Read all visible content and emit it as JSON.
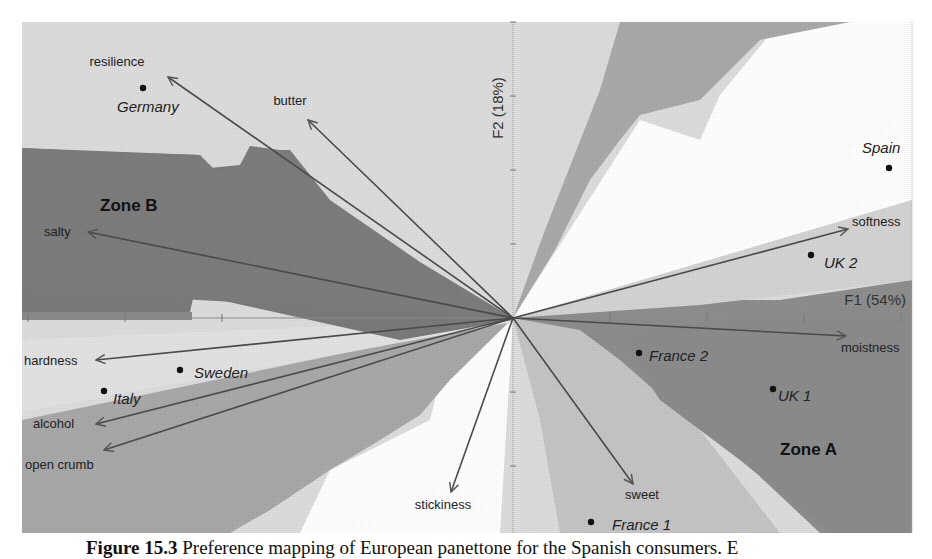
{
  "chart_data": {
    "type": "scatter",
    "subtype": "biplot-preference-map",
    "title": "",
    "xlabel": "F1 (54%)",
    "ylabel": "F2 (18%)",
    "origin_px": [
      513,
      318
    ],
    "x_tick_spacing_px": 97,
    "y_tick_spacing_px": 74,
    "grid": false,
    "legend": null,
    "zones": [
      {
        "label": "Zone A",
        "pos": [
          780,
          455
        ]
      },
      {
        "label": "Zone B",
        "pos": [
          100,
          211
        ]
      }
    ],
    "variables": [
      {
        "name": "butter",
        "end": [
          308,
          120
        ],
        "label_pos": [
          290,
          105
        ],
        "anchor": "middle"
      },
      {
        "name": "resilience",
        "end": [
          168,
          77
        ],
        "label_pos": [
          117,
          66
        ],
        "anchor": "middle"
      },
      {
        "name": "salty",
        "end": [
          88,
          232
        ],
        "label_pos": [
          44,
          236
        ],
        "anchor": "start"
      },
      {
        "name": "softness",
        "end": [
          848,
          229
        ],
        "label_pos": [
          852,
          226
        ],
        "anchor": "start"
      },
      {
        "name": "moistness",
        "end": [
          846,
          336
        ],
        "label_pos": [
          841,
          352
        ],
        "anchor": "start"
      },
      {
        "name": "hardness",
        "end": [
          96,
          360
        ],
        "label_pos": [
          24,
          365
        ],
        "anchor": "start"
      },
      {
        "name": "alcohol",
        "end": [
          96,
          424
        ],
        "label_pos": [
          33,
          428
        ],
        "anchor": "start"
      },
      {
        "name": "open crumb",
        "end": [
          104,
          450
        ],
        "label_pos": [
          25,
          469
        ],
        "anchor": "start"
      },
      {
        "name": "stickiness",
        "end": [
          451,
          492
        ],
        "label_pos": [
          443,
          509
        ],
        "anchor": "middle"
      },
      {
        "name": "sweet",
        "end": [
          633,
          484
        ],
        "label_pos": [
          642,
          499
        ],
        "anchor": "middle"
      }
    ],
    "observations": [
      {
        "name": "Germany",
        "point": [
          143,
          88
        ],
        "label_pos": [
          117,
          112
        ],
        "anchor": "start"
      },
      {
        "name": "Spain",
        "point": [
          889,
          168
        ],
        "label_pos": [
          862,
          153
        ],
        "anchor": "start"
      },
      {
        "name": "UK 2",
        "point": [
          811,
          255
        ],
        "label_pos": [
          824,
          268
        ],
        "anchor": "start"
      },
      {
        "name": "Sweden",
        "point": [
          180,
          370
        ],
        "label_pos": [
          194,
          378
        ],
        "anchor": "start"
      },
      {
        "name": "Italy",
        "point": [
          104,
          391
        ],
        "label_pos": [
          113,
          404
        ],
        "anchor": "start"
      },
      {
        "name": "France 2",
        "point": [
          639,
          353
        ],
        "label_pos": [
          649,
          361
        ],
        "anchor": "start"
      },
      {
        "name": "UK 1",
        "point": [
          773,
          389
        ],
        "label_pos": [
          778,
          401
        ],
        "anchor": "start"
      },
      {
        "name": "France 1",
        "point": [
          591,
          522
        ],
        "label_pos": [
          612,
          530
        ],
        "anchor": "start"
      }
    ]
  },
  "caption": {
    "label": "Figure 15.3",
    "text": " Preference mapping of European panettone for the Spanish consumers. E"
  }
}
